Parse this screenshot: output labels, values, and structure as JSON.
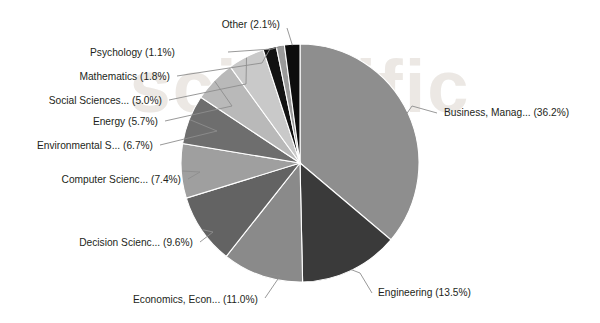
{
  "chart_data": {
    "type": "pie",
    "title": "",
    "subtitle": "",
    "xlabel": "",
    "ylabel": "",
    "legend_position": "none",
    "labels_position": "outside-with-leader-lines",
    "grid": false,
    "start_angle_deg": 0,
    "direction": "clockwise",
    "units": "percent",
    "categories": [
      "Business, Manag...",
      "Engineering",
      "Economics, Econ...",
      "Decision Scienc...",
      "Computer Scienc...",
      "Environmental S...",
      "Energy",
      "Social Sciences...",
      "Mathematics",
      "Psychology",
      "Other"
    ],
    "values": [
      36.2,
      13.5,
      11.0,
      9.6,
      7.4,
      6.7,
      5.7,
      5.0,
      1.8,
      1.1,
      2.1
    ],
    "colors": [
      "#8e8e8e",
      "#3a3a3a",
      "#8a8a8a",
      "#636363",
      "#9f9f9f",
      "#6e6e6e",
      "#b9b9b9",
      "#c9c9c9",
      "#121212",
      "#9a9a9a",
      "#0d0d0d"
    ],
    "slice_labels": [
      "Business, Manag... (36.2%)",
      "Engineering (13.5%)",
      "Economics, Econ... (11.0%)",
      "Decision Scienc... (9.6%)",
      "Computer Scienc... (7.4%)",
      "Environmental S... (6.7%)",
      "Energy (5.7%)",
      "Social Sciences... (5.0%)",
      "Mathematics (1.8%)",
      "Psychology (1.1%)",
      "Other (2.1%)"
    ]
  },
  "labels": {
    "business": "Business, Manag... (36.2%)",
    "engineering": "Engineering (13.5%)",
    "economics": "Economics, Econ... (11.0%)",
    "decision_sciences": "Decision Scienc... (9.6%)",
    "computer_science": "Computer Scienc... (7.4%)",
    "environmental": "Environmental S... (6.7%)",
    "energy": "Energy (5.7%)",
    "social_sciences": "Social Sciences... (5.0%)",
    "mathematics": "Mathematics (1.8%)",
    "psychology": "Psychology (1.1%)",
    "other": "Other (2.1%)"
  },
  "watermark": {
    "text": "scientific",
    "color": "#e9e5e0"
  },
  "style": {
    "background": "#ffffff",
    "label_color": "#231f20",
    "leader_line_color": "#8d8d8d",
    "slice_border_color": "#ffffff"
  }
}
